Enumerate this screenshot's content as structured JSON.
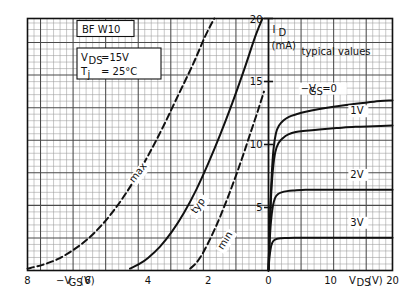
{
  "chart_data": {
    "type": "line",
    "device": "BF W10",
    "conditions": {
      "vds_label": "V",
      "vds_sub": "DS",
      "vds_value": "=15V",
      "tj_label": "T",
      "tj_sub": "j",
      "tj_value": "= 25°C"
    },
    "annotation_typical": "typical values",
    "ylabel_main": "I",
    "ylabel_sub": "D",
    "ylabel_unit": "(mA)",
    "ylim": [
      0,
      20
    ],
    "yticks": [
      "5",
      "10",
      "15",
      "20"
    ],
    "ytick_values": [
      5,
      10,
      15,
      20
    ],
    "grid": true,
    "left_axis": {
      "label_prefix": "−V",
      "label_sub": "GS",
      "label_unit": "(V)",
      "xlim": [
        -8,
        0
      ],
      "ticks": [
        "8",
        "6",
        "4",
        "2"
      ],
      "tick_values": [
        -8,
        -6,
        -4,
        -2
      ],
      "zero_label": "0"
    },
    "right_axis": {
      "label_main": "V",
      "label_sub": "DS",
      "label_unit": "(V)",
      "xlim": [
        0,
        20
      ],
      "ticks": [
        "10",
        "20"
      ],
      "tick_values": [
        10,
        20
      ]
    },
    "transfer_curves": [
      {
        "name": "max",
        "label": "max",
        "style": "dashed",
        "points": [
          [
            -8.0,
            0.15
          ],
          [
            -7.5,
            0.45
          ],
          [
            -7.0,
            0.9
          ],
          [
            -6.5,
            1.6
          ],
          [
            -6.0,
            2.5
          ],
          [
            -5.5,
            3.7
          ],
          [
            -5.0,
            5.2
          ],
          [
            -4.5,
            7.0
          ],
          [
            -4.0,
            9.1
          ],
          [
            -3.5,
            11.4
          ],
          [
            -3.0,
            13.9
          ],
          [
            -2.5,
            16.4
          ],
          [
            -2.1,
            18.6
          ],
          [
            -1.8,
            20.0
          ]
        ]
      },
      {
        "name": "typ",
        "label": "typ",
        "style": "solid",
        "points": [
          [
            -4.6,
            0.15
          ],
          [
            -4.3,
            0.5
          ],
          [
            -4.0,
            1.0
          ],
          [
            -3.6,
            1.9
          ],
          [
            -3.2,
            3.1
          ],
          [
            -2.8,
            4.6
          ],
          [
            -2.4,
            6.4
          ],
          [
            -2.0,
            8.5
          ],
          [
            -1.6,
            10.8
          ],
          [
            -1.2,
            13.3
          ],
          [
            -0.8,
            16.0
          ],
          [
            -0.45,
            18.5
          ],
          [
            -0.2,
            20.0
          ]
        ]
      },
      {
        "name": "min",
        "label": "min",
        "style": "dashed",
        "points": [
          [
            -2.6,
            0.15
          ],
          [
            -2.4,
            0.6
          ],
          [
            -2.2,
            1.3
          ],
          [
            -2.0,
            2.2
          ],
          [
            -1.8,
            3.2
          ],
          [
            -1.6,
            4.3
          ],
          [
            -1.35,
            5.8
          ],
          [
            -1.1,
            7.4
          ],
          [
            -0.85,
            9.1
          ],
          [
            -0.6,
            10.9
          ],
          [
            -0.35,
            12.7
          ],
          [
            -0.15,
            14.2
          ]
        ]
      }
    ],
    "output_curves": [
      {
        "name": "vgs-0",
        "label": "−V",
        "label_sub": "GS",
        "label_eq": "=0",
        "saturation_ma": 13.2,
        "points": [
          [
            0,
            0
          ],
          [
            0.25,
            4.2
          ],
          [
            0.5,
            7.4
          ],
          [
            0.8,
            9.6
          ],
          [
            1.2,
            10.9
          ],
          [
            1.7,
            11.5
          ],
          [
            2.4,
            11.9
          ],
          [
            3.3,
            12.2
          ],
          [
            4.5,
            12.4
          ],
          [
            6.0,
            12.6
          ],
          [
            8.0,
            12.8
          ],
          [
            10.5,
            13.0
          ],
          [
            13.5,
            13.2
          ],
          [
            17,
            13.4
          ],
          [
            20,
            13.5
          ]
        ]
      },
      {
        "name": "vgs-1",
        "label": "1V",
        "saturation_ma": 11.4,
        "points": [
          [
            0,
            0
          ],
          [
            0.2,
            3.4
          ],
          [
            0.45,
            6.2
          ],
          [
            0.75,
            8.2
          ],
          [
            1.1,
            9.4
          ],
          [
            1.6,
            10.1
          ],
          [
            2.3,
            10.5
          ],
          [
            3.2,
            10.8
          ],
          [
            4.4,
            11.0
          ],
          [
            6.0,
            11.1
          ],
          [
            8.2,
            11.2
          ],
          [
            11,
            11.3
          ],
          [
            14,
            11.4
          ],
          [
            17,
            11.45
          ],
          [
            20,
            11.5
          ]
        ]
      },
      {
        "name": "vgs-2",
        "label": "2V",
        "saturation_ma": 6.4,
        "points": [
          [
            0,
            0
          ],
          [
            0.18,
            2.2
          ],
          [
            0.4,
            3.9
          ],
          [
            0.7,
            5.1
          ],
          [
            1.05,
            5.75
          ],
          [
            1.5,
            6.05
          ],
          [
            2.1,
            6.2
          ],
          [
            3.0,
            6.3
          ],
          [
            4.2,
            6.35
          ],
          [
            6.0,
            6.4
          ],
          [
            8.5,
            6.4
          ],
          [
            11.5,
            6.4
          ],
          [
            15,
            6.4
          ],
          [
            20,
            6.4
          ]
        ]
      },
      {
        "name": "vgs-3",
        "label": "3V",
        "saturation_ma": 2.6,
        "points": [
          [
            0,
            0
          ],
          [
            0.15,
            1.0
          ],
          [
            0.35,
            1.75
          ],
          [
            0.6,
            2.2
          ],
          [
            0.95,
            2.42
          ],
          [
            1.4,
            2.52
          ],
          [
            2.0,
            2.56
          ],
          [
            2.9,
            2.58
          ],
          [
            4.2,
            2.6
          ],
          [
            6.0,
            2.6
          ],
          [
            9,
            2.6
          ],
          [
            13,
            2.6
          ],
          [
            16,
            2.6
          ],
          [
            20,
            2.6
          ]
        ]
      }
    ],
    "colors": {
      "ink": "#111111",
      "grid_minor": "#9a9a9a",
      "grid_major": "#4a4a4a",
      "background": "#ffffff"
    }
  }
}
